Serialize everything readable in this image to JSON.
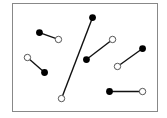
{
  "diagram": {
    "colors": {
      "frame": "#888888",
      "line": "#111111",
      "filled_dot": "#000000",
      "open_dot_fill": "#ffffff",
      "open_dot_stroke": "#555555"
    },
    "segments": [
      {
        "id": "a",
        "filled": [
          0.186,
          0.269
        ],
        "open": [
          0.317,
          0.333
        ]
      },
      {
        "id": "b",
        "filled": [
          0.221,
          0.639
        ],
        "open": [
          0.103,
          0.5
        ]
      },
      {
        "id": "c",
        "filled": [
          0.552,
          0.13
        ],
        "open": [
          0.338,
          0.88
        ]
      },
      {
        "id": "d",
        "filled": [
          0.51,
          0.519
        ],
        "open": [
          0.69,
          0.333
        ]
      },
      {
        "id": "e",
        "filled": [
          0.897,
          0.417
        ],
        "open": [
          0.724,
          0.583
        ]
      },
      {
        "id": "f",
        "filled": [
          0.669,
          0.815
        ],
        "open": [
          0.897,
          0.815
        ]
      }
    ]
  }
}
